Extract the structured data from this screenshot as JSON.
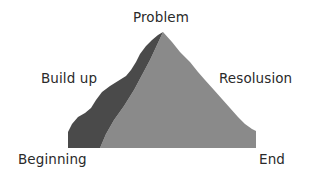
{
  "diagram": {
    "type": "story-arc-mountain",
    "labels": {
      "peak": "Problem",
      "left_slope": "Build up",
      "right_slope": "Resolusion",
      "start": "Beginning",
      "finish": "End"
    },
    "colors": {
      "dark_face": "#4a4a4a",
      "light_face": "#8a8a8a",
      "text": "#2a2a2a",
      "background": "#ffffff"
    }
  }
}
